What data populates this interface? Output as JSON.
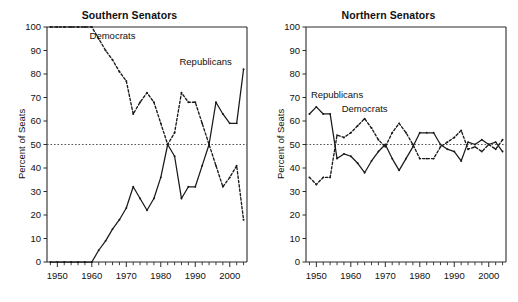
{
  "figure": {
    "background": "#ffffff",
    "ink": "#1a1a1a",
    "refline_color": "#555555"
  },
  "chart_data": [
    {
      "type": "line",
      "title": "Southern Senators",
      "xlabel": "",
      "ylabel": "Percent of Seats",
      "xlim": [
        1947,
        2005
      ],
      "ylim": [
        0,
        100
      ],
      "grid": false,
      "legend_position": "inline-annotation",
      "reference_line": {
        "y": 50,
        "style": "dotted"
      },
      "yticks": [
        0,
        10,
        20,
        30,
        40,
        50,
        60,
        70,
        80,
        90,
        100
      ],
      "xticks_labeled": [
        1950,
        1960,
        1970,
        1980,
        1990,
        2000
      ],
      "xticks_minor_step": 2,
      "annotations": [
        {
          "text": "Democrats",
          "x": 1966,
          "y": 95
        },
        {
          "text": "Republicans",
          "x": 1993,
          "y": 84
        }
      ],
      "x": [
        1948,
        1950,
        1952,
        1954,
        1956,
        1958,
        1960,
        1962,
        1964,
        1966,
        1968,
        1970,
        1972,
        1974,
        1976,
        1978,
        1980,
        1982,
        1984,
        1986,
        1988,
        1990,
        1992,
        1994,
        1996,
        1998,
        2000,
        2002,
        2004
      ],
      "series": [
        {
          "name": "Democrats",
          "style": "dashed",
          "values": [
            100,
            100,
            100,
            100,
            100,
            100,
            100,
            95,
            90,
            86,
            81,
            77,
            63,
            68,
            72,
            68,
            59,
            50,
            55,
            72,
            68,
            68,
            59,
            50,
            41,
            32,
            36,
            41,
            18
          ]
        },
        {
          "name": "Republicans",
          "style": "solid",
          "values": [
            0,
            0,
            0,
            0,
            0,
            0,
            0,
            5,
            9,
            14,
            18,
            23,
            32,
            27,
            22,
            27,
            36,
            50,
            45,
            27,
            32,
            32,
            41,
            50,
            68,
            63,
            59,
            59,
            82
          ]
        }
      ]
    },
    {
      "type": "line",
      "title": "Northern Senators",
      "xlabel": "",
      "ylabel": "Percent of Seats",
      "xlim": [
        1947,
        2005
      ],
      "ylim": [
        0,
        100
      ],
      "grid": false,
      "legend_position": "inline-annotation",
      "reference_line": {
        "y": 50,
        "style": "dotted"
      },
      "yticks": [
        0,
        10,
        20,
        30,
        40,
        50,
        60,
        70,
        80,
        90,
        100
      ],
      "xticks_labeled": [
        1950,
        1960,
        1970,
        1980,
        1990,
        2000
      ],
      "xticks_minor_step": 2,
      "annotations": [
        {
          "text": "Republicans",
          "x": 1956,
          "y": 70
        },
        {
          "text": "Democrats",
          "x": 1964,
          "y": 64
        }
      ],
      "x": [
        1948,
        1950,
        1952,
        1954,
        1956,
        1958,
        1960,
        1962,
        1964,
        1966,
        1968,
        1970,
        1972,
        1974,
        1976,
        1978,
        1980,
        1982,
        1984,
        1986,
        1988,
        1990,
        1992,
        1994,
        1996,
        1998,
        2000,
        2002,
        2004
      ],
      "series": [
        {
          "name": "Republicans",
          "style": "solid",
          "values": [
            63,
            66,
            63,
            63,
            44,
            46,
            45,
            42,
            38,
            43,
            47,
            50,
            44,
            39,
            44,
            49,
            55,
            55,
            55,
            50,
            48,
            47,
            43,
            51,
            50,
            52,
            50,
            51,
            47
          ]
        },
        {
          "name": "Democrats",
          "style": "dashed",
          "values": [
            36,
            33,
            36,
            36,
            54,
            53,
            55,
            58,
            61,
            57,
            52,
            49,
            55,
            59,
            55,
            50,
            44,
            44,
            44,
            49,
            51,
            53,
            56,
            48,
            49,
            47,
            50,
            48,
            52
          ]
        }
      ]
    }
  ]
}
